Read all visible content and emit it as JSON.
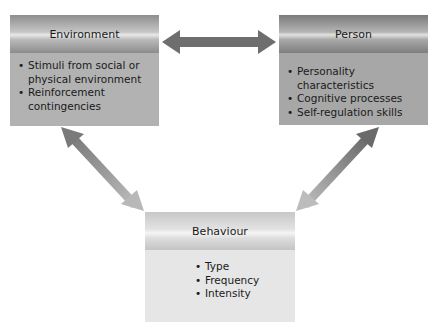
{
  "nodes": {
    "environment": {
      "title": "Environment",
      "items": [
        "Stimuli from social or physical environment",
        "Reinforcement contingencies"
      ]
    },
    "person": {
      "title": "Person",
      "items": [
        "Personality characteristics",
        "Cognitive processes",
        "Self-regulation skills"
      ]
    },
    "behaviour": {
      "title": "Behaviour",
      "items": [
        "Type",
        "Frequency",
        "Intensity"
      ]
    }
  },
  "edges": [
    {
      "from": "environment",
      "to": "person",
      "type": "bidirectional",
      "color": "#6e6e6e"
    },
    {
      "from": "environment",
      "to": "behaviour",
      "type": "bidirectional",
      "color_start": "#7a7a7a",
      "color_end": "#b8b8b8"
    },
    {
      "from": "person",
      "to": "behaviour",
      "type": "bidirectional",
      "color_start": "#6a6a6a",
      "color_end": "#b8b8b8"
    }
  ]
}
